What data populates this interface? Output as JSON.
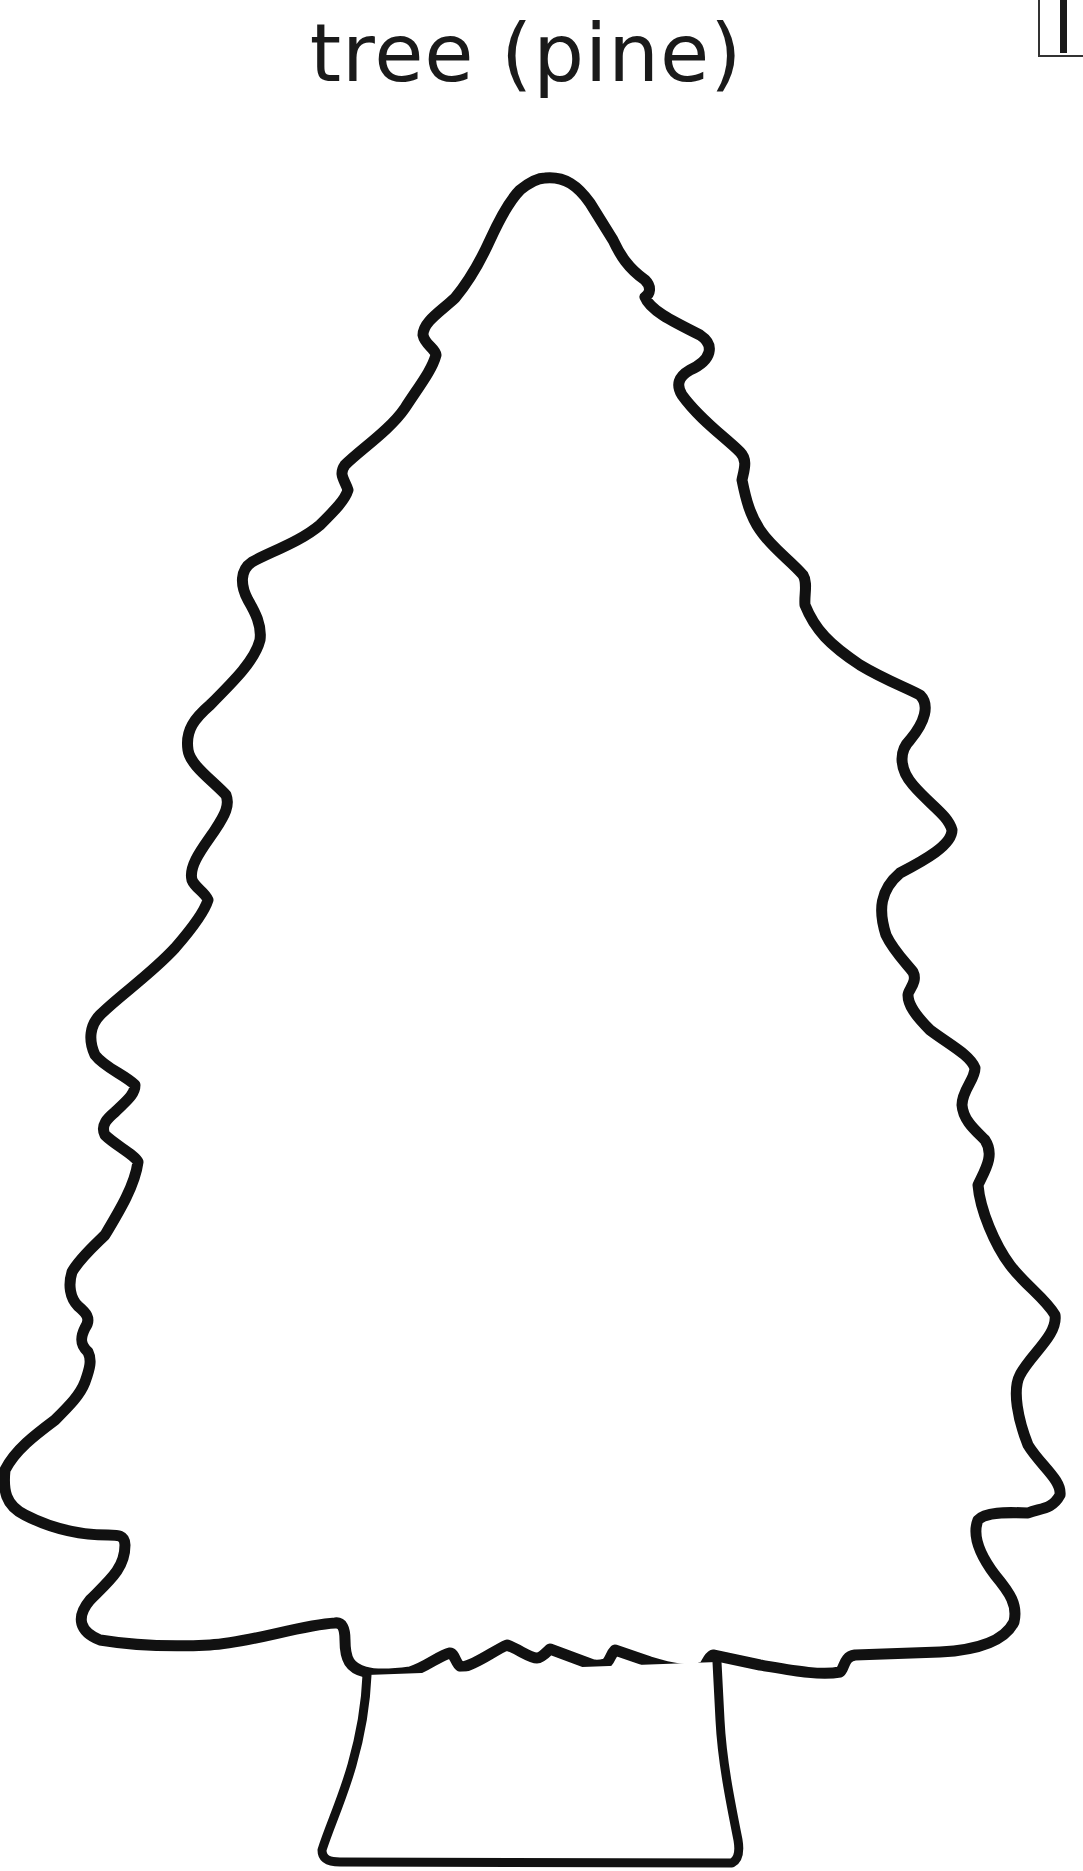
{
  "title": "tree (pine)",
  "corner_mark": {
    "glyph": "I",
    "icon": "page-edge-marker-icon"
  },
  "drawing": {
    "subject": "pine tree outline",
    "icon": "pine-tree-outline-icon",
    "stroke_color": "#111111",
    "fill_color": "#ffffff"
  }
}
